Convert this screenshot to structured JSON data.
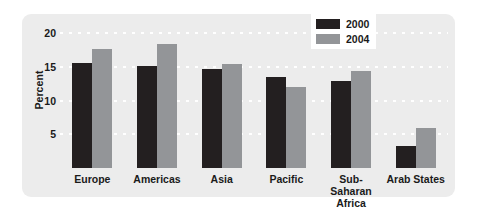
{
  "chart_data": {
    "type": "bar",
    "title": "",
    "xlabel": "",
    "ylabel": "Percent",
    "ylim": [
      0,
      22
    ],
    "yticks": [
      5,
      10,
      15,
      20
    ],
    "ytick_labels": [
      "5",
      "10",
      "15",
      "20"
    ],
    "grid": true,
    "grid_style": "white dotted horizontal",
    "legend_position": "top-right",
    "categories": [
      "Europe",
      "Americas",
      "Asia",
      "Pacific",
      "Sub-Saharan\nAfrica",
      "Arab States"
    ],
    "series": [
      {
        "name": "2000",
        "color": "#231f20",
        "values": [
          15.6,
          15.2,
          14.7,
          13.5,
          13.0,
          3.3
        ]
      },
      {
        "name": "2004",
        "color": "#939598",
        "values": [
          17.7,
          18.5,
          15.5,
          12.0,
          14.4,
          5.9
        ]
      }
    ]
  },
  "legend": {
    "items": [
      {
        "label": "2000",
        "color": "#231f20"
      },
      {
        "label": "2004",
        "color": "#939598"
      }
    ]
  },
  "colors": {
    "panel_background": "#ececec",
    "page_background": "#ffffff",
    "gridline": "#ffffff",
    "text": "#1a1a1a",
    "series_2000": "#231f20",
    "series_2004": "#939598"
  }
}
